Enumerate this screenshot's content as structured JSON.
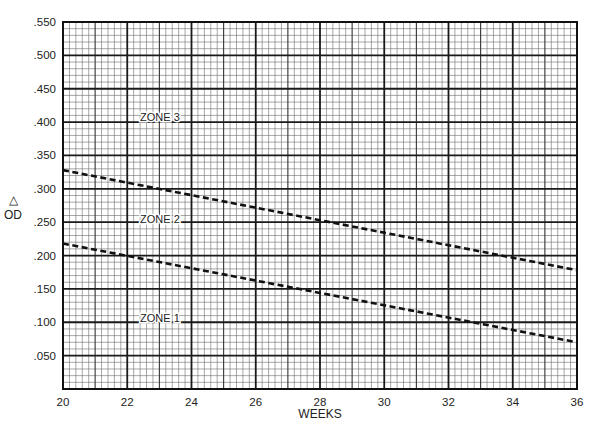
{
  "chart_data": {
    "type": "line",
    "title": "",
    "xlabel": "WEEKS",
    "ylabel": "△ OD",
    "ylabel_symbol": "△",
    "ylabel_text": "OD",
    "xlim": [
      20,
      36
    ],
    "ylim": [
      0,
      0.55
    ],
    "grid": true,
    "grid_major_x": 2,
    "grid_medium_x": 1,
    "grid_minor_x": 0.2,
    "grid_major_y": 0.05,
    "grid_minor_y": 0.01,
    "x_ticks": [
      20,
      22,
      24,
      26,
      28,
      30,
      32,
      34,
      36
    ],
    "x_tick_labels": [
      "20",
      "22",
      "24",
      "26",
      "28",
      "30",
      "32",
      "34",
      "36"
    ],
    "y_ticks": [
      0.05,
      0.1,
      0.15,
      0.2,
      0.25,
      0.3,
      0.35,
      0.4,
      0.45,
      0.5,
      0.55
    ],
    "y_tick_labels": [
      ".050",
      ".100",
      ".150",
      ".200",
      ".250",
      ".300",
      ".350",
      ".400",
      ".450",
      ".500",
      ".550"
    ],
    "series": [
      {
        "name": "Zone 2/3 boundary",
        "style": "dashed",
        "x": [
          20,
          28,
          36
        ],
        "values": [
          0.328,
          0.253,
          0.178
        ]
      },
      {
        "name": "Zone 1/2 boundary",
        "style": "dashed",
        "x": [
          20,
          28,
          36
        ],
        "values": [
          0.218,
          0.144,
          0.07
        ]
      }
    ],
    "annotations": [
      {
        "text": "ZONE 3",
        "x": 22.4,
        "y": 0.408
      },
      {
        "text": "ZONE 2",
        "x": 22.4,
        "y": 0.255
      },
      {
        "text": "ZONE 1",
        "x": 22.4,
        "y": 0.107
      }
    ],
    "legend": "none"
  },
  "colors": {
    "line": "#111111",
    "grid_major": "#1a1a1a",
    "grid_minor": "#6b6b6b",
    "background": "#ffffff"
  }
}
